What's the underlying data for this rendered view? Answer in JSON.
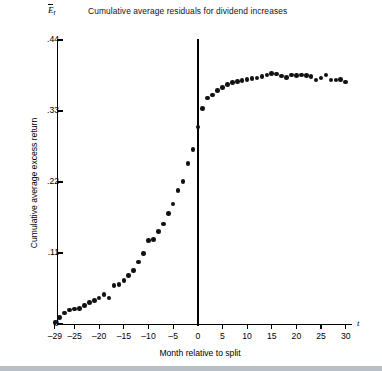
{
  "chart": {
    "title": "Cumulative average residuals for dividend increases",
    "y_symbol": "E",
    "y_symbol_sub": "r",
    "x_symbol": "t",
    "xlabel": "Month relative to split",
    "ylabel": "Cumulative average excess return",
    "y_ticks": [
      "0",
      ".11",
      ".22",
      ".33",
      ".44"
    ],
    "x_ticks": [
      "–29",
      "–25",
      "–20",
      "–15",
      "–10",
      "–5",
      "0",
      "5",
      "10",
      "15",
      "20",
      "25",
      "30"
    ],
    "marker_color": "#111111",
    "axis_color": "#000000",
    "background_color": "#ffffff"
  },
  "chart_data": {
    "type": "scatter",
    "title": "Cumulative average residuals for dividend increases",
    "xlabel": "Month relative to split",
    "ylabel": "Cumulative average excess return",
    "xlim": [
      -30,
      31
    ],
    "ylim": [
      0,
      0.44
    ],
    "xticks": [
      -29,
      -25,
      -20,
      -15,
      -10,
      -5,
      0,
      5,
      10,
      15,
      20,
      25,
      30
    ],
    "xticklabels": [
      "–29",
      "–25",
      "–20",
      "–15",
      "–10",
      "–5",
      "0",
      "5",
      "10",
      "15",
      "20",
      "25",
      "30"
    ],
    "yticks": [
      0,
      0.11,
      0.22,
      0.33,
      0.44
    ],
    "yticklabels": [
      "0",
      ".11",
      ".22",
      ".33",
      ".44"
    ],
    "grid": false,
    "legend": false,
    "annotations": [
      {
        "type": "vline",
        "x": 0,
        "label": "split / event month"
      }
    ],
    "series": [
      {
        "name": "Cumulative average excess return",
        "x": [
          -29,
          -28,
          -27,
          -26,
          -25,
          -24,
          -23,
          -22,
          -21,
          -20,
          -19,
          -18,
          -17,
          -16,
          -15,
          -14,
          -13,
          -12,
          -11,
          -10,
          -9,
          -8,
          -7,
          -6,
          -5,
          -4,
          -3,
          -2,
          -1,
          0,
          1,
          2,
          3,
          4,
          5,
          6,
          7,
          8,
          9,
          10,
          11,
          12,
          13,
          14,
          15,
          16,
          17,
          18,
          19,
          20,
          21,
          22,
          23,
          24,
          25,
          26,
          27,
          28,
          29,
          30
        ],
        "y": [
          0.002,
          0.01,
          0.017,
          0.022,
          0.023,
          0.024,
          0.029,
          0.033,
          0.036,
          0.04,
          0.046,
          0.04,
          0.06,
          0.061,
          0.067,
          0.075,
          0.083,
          0.096,
          0.109,
          0.129,
          0.131,
          0.143,
          0.155,
          0.171,
          0.186,
          0.207,
          0.221,
          0.249,
          0.27,
          0.305,
          0.334,
          0.35,
          0.355,
          0.362,
          0.366,
          0.371,
          0.374,
          0.376,
          0.377,
          0.379,
          0.38,
          0.381,
          0.383,
          0.386,
          0.388,
          0.387,
          0.384,
          0.382,
          0.386,
          0.385,
          0.386,
          0.385,
          0.383,
          0.378,
          0.381,
          0.386,
          0.378,
          0.378,
          0.379,
          0.375
        ]
      }
    ]
  }
}
